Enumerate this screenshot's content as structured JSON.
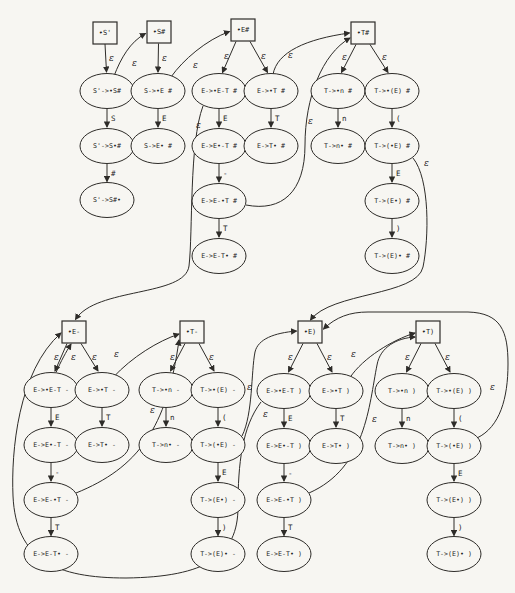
{
  "figure": {
    "kind": "lr-item-nfa-diagram",
    "paper_color": "#f7f6f2",
    "stroke_color": "#2e2c29",
    "text_color": "#1d1d1d",
    "epsilon_symbol": "ε",
    "stations": [
      {
        "id": "st_sp",
        "label": "•S'",
        "x": 105,
        "y": 33
      },
      {
        "id": "st_sh",
        "label": "•S#",
        "x": 159,
        "y": 32
      },
      {
        "id": "st_eh",
        "label": "•E#",
        "x": 243,
        "y": 30
      },
      {
        "id": "st_th",
        "label": "•T#",
        "x": 363,
        "y": 33
      },
      {
        "id": "st_em",
        "label": "•E-",
        "x": 74,
        "y": 332
      },
      {
        "id": "st_tm",
        "label": "•T-",
        "x": 192,
        "y": 332
      },
      {
        "id": "st_ep",
        "label": "•E)",
        "x": 310,
        "y": 332
      },
      {
        "id": "st_tp",
        "label": "•T)",
        "x": 428,
        "y": 332
      }
    ],
    "items": [
      {
        "id": "i1",
        "label": "S'->•S#",
        "x": 107,
        "y": 91
      },
      {
        "id": "i2",
        "label": "S'->S•#",
        "x": 107,
        "y": 146
      },
      {
        "id": "i3",
        "label": "S'->S#•",
        "x": 107,
        "y": 200
      },
      {
        "id": "i4",
        "label": "S->•E #",
        "x": 158,
        "y": 91
      },
      {
        "id": "i5",
        "label": "S->E• #",
        "x": 158,
        "y": 146
      },
      {
        "id": "i6",
        "label": "E->•E-T #",
        "x": 219,
        "y": 91
      },
      {
        "id": "i7",
        "label": "E->•T #",
        "x": 271,
        "y": 91
      },
      {
        "id": "i8",
        "label": "E->E•-T #",
        "x": 219,
        "y": 146
      },
      {
        "id": "i9",
        "label": "E->T• #",
        "x": 271,
        "y": 146
      },
      {
        "id": "i10",
        "label": "E->E-•T #",
        "x": 219,
        "y": 201
      },
      {
        "id": "i11",
        "label": "E->E-T• #",
        "x": 219,
        "y": 256
      },
      {
        "id": "i12",
        "label": "T->•n #",
        "x": 338,
        "y": 91
      },
      {
        "id": "i13",
        "label": "T->•(E) #",
        "x": 392,
        "y": 91
      },
      {
        "id": "i14",
        "label": "T->n• #",
        "x": 338,
        "y": 146
      },
      {
        "id": "i15",
        "label": "T->(•E) #",
        "x": 392,
        "y": 146
      },
      {
        "id": "i16",
        "label": "T->(E•) #",
        "x": 392,
        "y": 201
      },
      {
        "id": "i17",
        "label": "T->(E)• #",
        "x": 392,
        "y": 256
      },
      {
        "id": "m6",
        "label": "E->•E-T -",
        "x": 51,
        "y": 390
      },
      {
        "id": "m7",
        "label": "E->•T -",
        "x": 102,
        "y": 390
      },
      {
        "id": "m8",
        "label": "E->E•-T -",
        "x": 51,
        "y": 445
      },
      {
        "id": "m9",
        "label": "E->T• -",
        "x": 102,
        "y": 445
      },
      {
        "id": "m10",
        "label": "E->E-•T -",
        "x": 51,
        "y": 500
      },
      {
        "id": "m11",
        "label": "E->E-T• -",
        "x": 51,
        "y": 554
      },
      {
        "id": "m12",
        "label": "T->•n -",
        "x": 166,
        "y": 390
      },
      {
        "id": "m13",
        "label": "T->•(E) -",
        "x": 218,
        "y": 390
      },
      {
        "id": "m14",
        "label": "T->n• -",
        "x": 166,
        "y": 445
      },
      {
        "id": "m15",
        "label": "T->(•E) -",
        "x": 218,
        "y": 445
      },
      {
        "id": "m16",
        "label": "T->(E•) -",
        "x": 218,
        "y": 500
      },
      {
        "id": "m17",
        "label": "T->(E)• -",
        "x": 218,
        "y": 554
      },
      {
        "id": "p6",
        "label": "E->•E-T )",
        "x": 284,
        "y": 391
      },
      {
        "id": "p7",
        "label": "E->•T )",
        "x": 336,
        "y": 391
      },
      {
        "id": "p8",
        "label": "E->E•-T )",
        "x": 284,
        "y": 446
      },
      {
        "id": "p9",
        "label": "E->T• )",
        "x": 336,
        "y": 446
      },
      {
        "id": "p10",
        "label": "E->E-•T )",
        "x": 284,
        "y": 500
      },
      {
        "id": "p11",
        "label": "E->E-T• )",
        "x": 284,
        "y": 554
      },
      {
        "id": "p12",
        "label": "T->•n )",
        "x": 402,
        "y": 391
      },
      {
        "id": "p13",
        "label": "T->•(E) )",
        "x": 454,
        "y": 391
      },
      {
        "id": "p14",
        "label": "T->n• )",
        "x": 402,
        "y": 446
      },
      {
        "id": "p15",
        "label": "T->(•E) )",
        "x": 454,
        "y": 446
      },
      {
        "id": "p16",
        "label": "T->(E•) )",
        "x": 454,
        "y": 500
      },
      {
        "id": "p17",
        "label": "T->(E)• )",
        "x": 454,
        "y": 554
      }
    ],
    "edges": [
      {
        "from": "st_sp",
        "to": "i1",
        "label": "ε",
        "d": "M105,44 L106.5,72",
        "lx": 109,
        "ly": 61
      },
      {
        "from": "st_sh",
        "to": "i4",
        "label": "ε",
        "d": "M158.5,43.5 L158,72",
        "lx": 162,
        "ly": 61
      },
      {
        "from": "st_eh",
        "to": "i6",
        "label": "ε",
        "d": "M236,41.5 L222.5,72.5",
        "lx": 224,
        "ly": 59
      },
      {
        "from": "st_eh",
        "to": "i7",
        "label": "ε",
        "d": "M250,41.5 L267.5,72.5",
        "lx": 261,
        "ly": 59
      },
      {
        "from": "st_th",
        "to": "i12",
        "label": "ε",
        "d": "M356,44.5 L341.5,72.5",
        "lx": 342,
        "ly": 60
      },
      {
        "from": "st_th",
        "to": "i13",
        "label": "ε",
        "d": "M370,44.5 L388,72.5",
        "lx": 382,
        "ly": 60
      },
      {
        "from": "st_em",
        "to": "m6",
        "label": "ε",
        "d": "M67,343.5 L55,371",
        "lx": 54,
        "ly": 360
      },
      {
        "from": "st_em",
        "to": "m7",
        "label": "ε",
        "d": "M81,343.5 L98,371",
        "lx": 92,
        "ly": 360
      },
      {
        "from": "st_tm",
        "to": "m12",
        "label": "ε",
        "d": "M185,343.5 L170.5,371",
        "lx": 170,
        "ly": 360
      },
      {
        "from": "st_tm",
        "to": "m13",
        "label": "ε",
        "d": "M199,343.5 L214,371",
        "lx": 209,
        "ly": 360
      },
      {
        "from": "st_ep",
        "to": "p6",
        "label": "ε",
        "d": "M303,343.5 L288.5,372",
        "lx": 288,
        "ly": 360
      },
      {
        "from": "st_ep",
        "to": "p7",
        "label": "ε",
        "d": "M317,343.5 L332,372",
        "lx": 327,
        "ly": 360
      },
      {
        "from": "st_tp",
        "to": "p12",
        "label": "ε",
        "d": "M421,343.5 L406.5,372",
        "lx": 405,
        "ly": 360
      },
      {
        "from": "st_tp",
        "to": "p13",
        "label": "ε",
        "d": "M435,343.5 L450,372",
        "lx": 445,
        "ly": 360
      },
      {
        "from": "i1",
        "to": "i2",
        "label": "S",
        "d": "M107,108.5 L107,127",
        "lx": 111,
        "ly": 121
      },
      {
        "from": "i2",
        "to": "i3",
        "label": "#",
        "d": "M107,163.5 L107,181.5",
        "lx": 111,
        "ly": 176
      },
      {
        "from": "i4",
        "to": "i5",
        "label": "E",
        "d": "M158,108.5 L158,127",
        "lx": 162,
        "ly": 121
      },
      {
        "from": "i6",
        "to": "i8",
        "label": "E",
        "d": "M219,108.5 L219,127",
        "lx": 223,
        "ly": 121
      },
      {
        "from": "i8",
        "to": "i10",
        "label": "-",
        "d": "M219,163.5 L219,182",
        "lx": 223,
        "ly": 176
      },
      {
        "from": "i10",
        "to": "i11",
        "label": "T",
        "d": "M219,218.5 L219,237",
        "lx": 223,
        "ly": 231
      },
      {
        "from": "i7",
        "to": "i9",
        "label": "T",
        "d": "M271,108.5 L271,127",
        "lx": 275,
        "ly": 121
      },
      {
        "from": "i12",
        "to": "i14",
        "label": "n",
        "d": "M338,108.5 L338,127",
        "lx": 342,
        "ly": 121
      },
      {
        "from": "i13",
        "to": "i15",
        "label": "(",
        "d": "M392,108.5 L392,127",
        "lx": 396,
        "ly": 121
      },
      {
        "from": "i15",
        "to": "i16",
        "label": "E",
        "d": "M392,163.5 L392,182",
        "lx": 396,
        "ly": 176
      },
      {
        "from": "i16",
        "to": "i17",
        "label": ")",
        "d": "M392,218.5 L392,237",
        "lx": 396,
        "ly": 231
      },
      {
        "from": "m6",
        "to": "m8",
        "label": "E",
        "d": "M51,407.5 L51,426",
        "lx": 55,
        "ly": 420
      },
      {
        "from": "m8",
        "to": "m10",
        "label": "-",
        "d": "M51,462.5 L51,481",
        "lx": 55,
        "ly": 475
      },
      {
        "from": "m10",
        "to": "m11",
        "label": "T",
        "d": "M51,517.5 L51,535.5",
        "lx": 55,
        "ly": 530
      },
      {
        "from": "m7",
        "to": "m9",
        "label": "T",
        "d": "M102,407.5 L102,426",
        "lx": 106,
        "ly": 420
      },
      {
        "from": "m12",
        "to": "m14",
        "label": "n",
        "d": "M166,407.5 L166,426",
        "lx": 170,
        "ly": 420
      },
      {
        "from": "m13",
        "to": "m15",
        "label": "(",
        "d": "M218,407.5 L218,426",
        "lx": 222,
        "ly": 420
      },
      {
        "from": "m15",
        "to": "m16",
        "label": "E",
        "d": "M218,462.5 L218,481",
        "lx": 222,
        "ly": 475
      },
      {
        "from": "m16",
        "to": "m17",
        "label": ")",
        "d": "M218,517.5 L218,535.5",
        "lx": 222,
        "ly": 530
      },
      {
        "from": "p6",
        "to": "p8",
        "label": "E",
        "d": "M284,408.5 L284,427",
        "lx": 288,
        "ly": 421
      },
      {
        "from": "p8",
        "to": "p10",
        "label": "-",
        "d": "M284,463.5 L284,481",
        "lx": 288,
        "ly": 476
      },
      {
        "from": "p10",
        "to": "p11",
        "label": "T",
        "d": "M284,517.5 L284,535.5",
        "lx": 288,
        "ly": 530
      },
      {
        "from": "p7",
        "to": "p9",
        "label": "T",
        "d": "M336,408.5 L336,427",
        "lx": 340,
        "ly": 421
      },
      {
        "from": "p12",
        "to": "p14",
        "label": "n",
        "d": "M402,408.5 L402,427",
        "lx": 406,
        "ly": 421
      },
      {
        "from": "p13",
        "to": "p15",
        "label": "(",
        "d": "M454,408.5 L454,427",
        "lx": 458,
        "ly": 421
      },
      {
        "from": "p15",
        "to": "p16",
        "label": "E",
        "d": "M454,463.5 L454,481",
        "lx": 458,
        "ly": 476
      },
      {
        "from": "p16",
        "to": "p17",
        "label": ")",
        "d": "M454,517.5 L454,535.5",
        "lx": 458,
        "ly": 530
      },
      {
        "from": "i1",
        "to": "st_sh",
        "label": "ε",
        "d": "M114,76 C121,58 130,42 145.5,33.5",
        "lx": 132,
        "ly": 66
      },
      {
        "from": "i4",
        "to": "st_eh",
        "label": "ε",
        "d": "M171,77 C183,60 206,40 229.5,31.5",
        "lx": 193,
        "ly": 68
      },
      {
        "from": "i7",
        "to": "st_th",
        "label": "ε",
        "d": "M273,74.5 C277,52 306,39 349.5,33",
        "lx": 288,
        "ly": 58
      },
      {
        "from": "i10",
        "to": "st_th",
        "label": "ε",
        "d": "M246,205 C282,212 305,192 305,145 C305,98 322,54 350,38",
        "lx": 308,
        "ly": 124
      },
      {
        "from": "i6",
        "to": "st_em",
        "label": "ε",
        "d": "M203,106 C189,143 193,232 189,266 C185,297 96,287 75.5,319.5",
        "lx": 196,
        "ly": 128
      },
      {
        "from": "i15",
        "to": "st_ep",
        "label": "ε",
        "d": "M413,158 C430,179 429,238 423,267 C417,296 331,292 310.5,320",
        "lx": 424,
        "ly": 166
      },
      {
        "from": "m6",
        "to": "st_em",
        "label": "ε",
        "d": "M56,372.5 C61,361 66,352 71,344",
        "lx": 71,
        "ly": 360
      },
      {
        "from": "m7",
        "to": "st_tm",
        "label": "ε",
        "d": "M113,377.5 C132,357 158,341 179,334",
        "lx": 114,
        "ly": 357
      },
      {
        "from": "m10",
        "to": "st_tm",
        "label": "ε",
        "d": "M76,493 C138,468 167,428 179,340",
        "lx": 150,
        "ly": 413
      },
      {
        "from": "m15",
        "to": "st_ep",
        "label": "ε",
        "d": "M242,436 C253,414 251,372 255,352 C258,339 274,333 296.5,331",
        "lx": 247,
        "ly": 390
      },
      {
        "from": "p6",
        "to": "st_em",
        "label": "ε",
        "d": "M261,402 C242,427 238,464 238,507 C238,556 206,577 126,578 C56,578 16,560 13,496 C11,452 18,371 61,333",
        "lx": 263,
        "ly": 417
      },
      {
        "from": "p7",
        "to": "st_tp",
        "label": "ε",
        "d": "M350,377.5 C363,358 392,340 415,333",
        "lx": 351,
        "ly": 357
      },
      {
        "from": "p10",
        "to": "st_tp",
        "label": "ε",
        "d": "M309,493 C366,468 369,405 377,365 C380,347 397,338 415,337",
        "lx": 372,
        "ly": 422
      },
      {
        "from": "p15",
        "to": "st_ep",
        "label": "ε",
        "d": "M477,438 C500,427 508,398 508,364 C508,331 501,313 468,312 L368,312 C350,312 336,317 323.5,329",
        "lx": 490,
        "ly": 390
      }
    ]
  }
}
